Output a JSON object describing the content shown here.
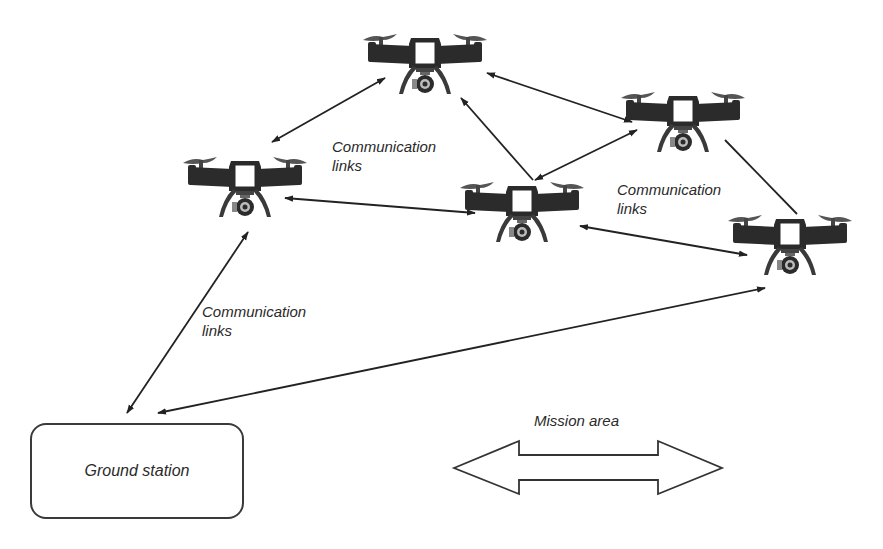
{
  "diagram": {
    "colors": {
      "line": "#222222",
      "drone_body": "#2b2b2b",
      "background": "#ffffff"
    },
    "labels": {
      "comm_top": [
        "Communication",
        "links"
      ],
      "comm_right": [
        "Communication",
        "links"
      ],
      "comm_left": [
        "Communication",
        "links"
      ],
      "ground_station": "Ground station",
      "mission_area": "Mission area"
    },
    "nodes": [
      {
        "id": "drone-top",
        "type": "drone",
        "cx": 425,
        "cy": 62
      },
      {
        "id": "drone-left",
        "type": "drone",
        "cx": 245,
        "cy": 185
      },
      {
        "id": "drone-center",
        "type": "drone",
        "cx": 522,
        "cy": 210
      },
      {
        "id": "drone-upper-right",
        "type": "drone",
        "cx": 683,
        "cy": 120
      },
      {
        "id": "drone-far-right",
        "type": "drone",
        "cx": 790,
        "cy": 243
      },
      {
        "id": "ground-station",
        "type": "box",
        "label": "Ground station"
      }
    ],
    "links": [
      {
        "from": "drone-left",
        "to": "drone-top",
        "arrows": "both"
      },
      {
        "from": "drone-top",
        "to": "drone-upper-right",
        "arrows": "both"
      },
      {
        "from": "drone-center",
        "to": "drone-top",
        "arrows": "end"
      },
      {
        "from": "drone-center",
        "to": "drone-upper-right",
        "arrows": "both"
      },
      {
        "from": "drone-left",
        "to": "drone-center",
        "arrows": "both"
      },
      {
        "from": "drone-upper-right",
        "to": "drone-far-right",
        "arrows": "none"
      },
      {
        "from": "drone-center",
        "to": "drone-far-right",
        "arrows": "both"
      },
      {
        "from": "drone-left",
        "to": "ground-station",
        "arrows": "both"
      },
      {
        "from": "drone-far-right",
        "to": "ground-station",
        "arrows": "both"
      }
    ]
  }
}
